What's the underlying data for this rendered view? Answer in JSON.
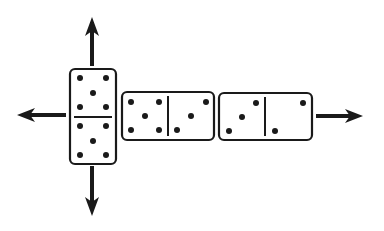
{
  "diagram": {
    "type": "domino-layout",
    "colors": {
      "ink": "#1a1a1a",
      "tile": "#ffffff"
    },
    "dominoes": [
      {
        "id": "spinner",
        "orientation": "vertical",
        "ends": [
          5,
          5
        ]
      },
      {
        "id": "middle",
        "orientation": "horizontal",
        "ends": [
          5,
          3
        ]
      },
      {
        "id": "right",
        "orientation": "horizontal",
        "ends": [
          3,
          2
        ]
      }
    ],
    "arrows": [
      {
        "direction": "up"
      },
      {
        "direction": "down"
      },
      {
        "direction": "left"
      },
      {
        "direction": "right"
      }
    ]
  }
}
